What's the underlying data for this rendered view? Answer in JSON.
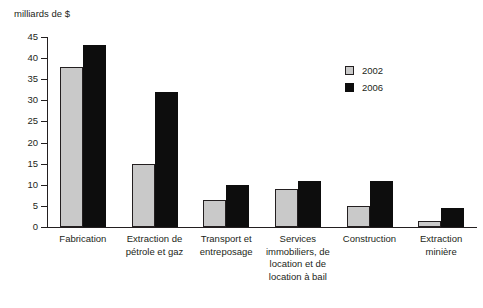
{
  "chart_data": {
    "type": "bar",
    "title": "",
    "subtitle": "",
    "xlabel": "",
    "ylabel": "milliards de $",
    "ylim": [
      0,
      45
    ],
    "yticks": [
      0,
      5,
      10,
      15,
      20,
      25,
      30,
      35,
      40,
      45
    ],
    "ytick_labels": [
      "0",
      "5",
      "10",
      "15",
      "20",
      "25",
      "30",
      "35",
      "40",
      "45"
    ],
    "grid": false,
    "legend_position": "upper right",
    "categories": [
      "Fabrication",
      "Extraction de pétrole et gaz",
      "Transport et entreposage",
      "Services immobiliers, de location et de location à bail",
      "Construction",
      "Extraction minière"
    ],
    "category_lines": [
      [
        "Fabrication"
      ],
      [
        "Extraction de",
        "pétrole et gaz"
      ],
      [
        "Transport et",
        "entreposage"
      ],
      [
        "Services",
        "immobiliers, de",
        "location et de",
        "location à bail"
      ],
      [
        "Construction"
      ],
      [
        "Extraction",
        "minière"
      ]
    ],
    "series": [
      {
        "name": "2002",
        "color": "#c9c9c9",
        "values": [
          38,
          15,
          6.5,
          9,
          5,
          1.5
        ]
      },
      {
        "name": "2006",
        "color": "#0d0d0d",
        "values": [
          43,
          32,
          10,
          11,
          11,
          4.5
        ]
      }
    ]
  },
  "legend": {
    "entries": [
      {
        "label": "2002"
      },
      {
        "label": "2006"
      }
    ]
  }
}
